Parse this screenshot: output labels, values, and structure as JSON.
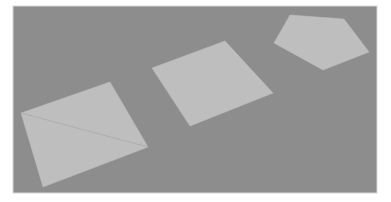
{
  "scene": {
    "description": "Rendered gray plane with three flat light-gray polygons in perspective",
    "colors": {
      "page_background": "#ffffff",
      "frame_border": "#d6d6d6",
      "plane": "#8d8d8d",
      "shape_fill": "#bebebe",
      "diagonal_line": "#a9a9a9"
    },
    "frame": {
      "x": 13,
      "y": 6,
      "width": 364,
      "height": 187
    },
    "shapes": [
      {
        "name": "quadrilateral-with-diagonal",
        "points": "21,113 110,82 148,147 43,187",
        "diagonal": {
          "x1": 21,
          "y1": 113,
          "x2": 148,
          "y2": 147
        }
      },
      {
        "name": "square",
        "points": "152,68 225,41 273,93 190,126"
      },
      {
        "name": "pentagon",
        "points": "290,15 344,19 369,52 323,70 274,43"
      }
    ]
  }
}
